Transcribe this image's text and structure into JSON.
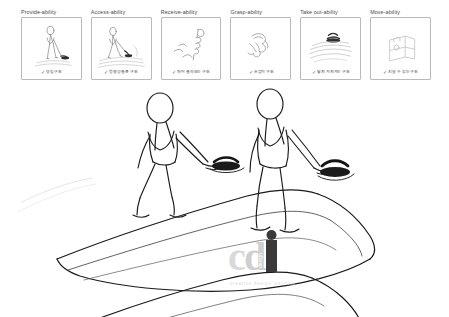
{
  "document": {
    "title": "Ability concept sketch board",
    "background_color": "#ffffff",
    "sketch_ink_color": "#1a1a1a",
    "panel_border_color": "#b9b9c2",
    "caption_color": "#3d3d3d",
    "check_color": "#4b6aa8",
    "watermark_color": "#dcdcdc"
  },
  "panels": [
    {
      "title": "Provide-ability",
      "caption": "당김 구조",
      "check": "✓",
      "art": "person-pulling-handle-sketch"
    },
    {
      "title": "Access-ability",
      "caption": "방향성을 준 구조",
      "check": "✓",
      "art": "person-stepping-onto-ramp-sketch"
    },
    {
      "title": "Receive-ability",
      "caption": "퍼어 올라오는 구조",
      "check": "✓",
      "art": "rising-hook-loop-sketch"
    },
    {
      "title": "Grasp-ability",
      "caption": "손잡이 구조",
      "check": "✓",
      "art": "grasping-hand-sketch"
    },
    {
      "title": "Take out-ability",
      "caption": "달져 가져가는 구조",
      "check": "✓",
      "art": "handle-lifting-out-sketch"
    },
    {
      "title": "Move-ability",
      "caption": "지닐 수 있는 구조",
      "check": "✓",
      "art": "portable-case-sketch"
    }
  ],
  "main_sketch": {
    "description": "Perspective line drawing of two walking figures on a large curved deck surface, each grasping a recessed dark handle",
    "figures": [
      {
        "name": "walking-figure-left",
        "action": "walking while gripping handle"
      },
      {
        "name": "walking-figure-right",
        "action": "walking while gripping handle"
      }
    ],
    "handles": [
      {
        "name": "recessed-handle-left"
      },
      {
        "name": "recessed-handle-right"
      }
    ]
  },
  "watermark": {
    "logo_text": "cdi",
    "vertical_text": "design",
    "tagline": "creative design institute"
  }
}
